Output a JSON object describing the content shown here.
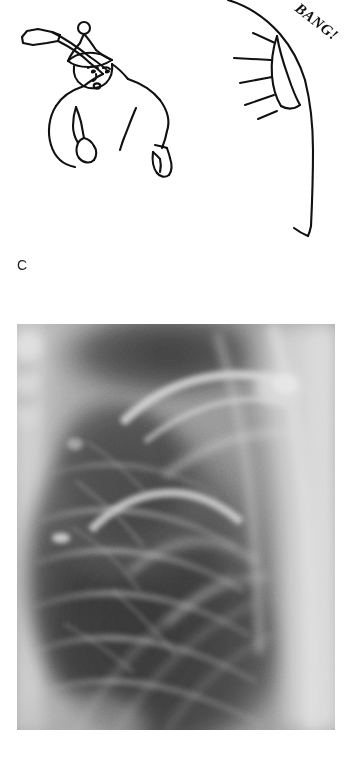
{
  "figure": {
    "kind": "medical-textbook-figure",
    "panels": [
      {
        "id": "C",
        "label": "C",
        "type": "line-drawing",
        "description": "Hand-drawn cartoon: a person in a bobble hat swinging a hockey stick, striking a curved surface with an impact burst",
        "caption_text": "BANG!",
        "elements": [
          "hockey-stick",
          "bobble-hat",
          "face",
          "torso",
          "left-mitt",
          "right-mitt",
          "curved-board",
          "impact-rays",
          "impact-text"
        ],
        "ink_color": "#111111",
        "paper_color": "#ffffff"
      },
      {
        "id": "D",
        "label": "D",
        "type": "radiograph",
        "description": "Chest radiograph (coned view of right hemithorax) with lettered annotation",
        "annotations": [
          {
            "name": "m",
            "text": "m"
          }
        ],
        "frame": {
          "x": 17,
          "y": 324,
          "width": 318,
          "height": 406
        },
        "tones": {
          "lightest": "#e8e8e8",
          "mid": "#9a9a9a",
          "dark": "#4a4a4a",
          "darkest": "#2a2a2a"
        }
      }
    ]
  },
  "panel_c": {
    "label": "C",
    "impact_text": "BANG!"
  },
  "panel_d": {
    "label": "D",
    "annotation_m": "m"
  }
}
